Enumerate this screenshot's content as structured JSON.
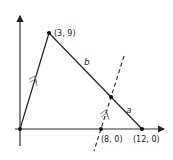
{
  "diagram": {
    "type": "coordinate-geometry",
    "points": {
      "origin": {
        "label": "",
        "x": 0,
        "y": 0
      },
      "apex": {
        "label": "(3, 9)",
        "x": 3,
        "y": 9
      },
      "right_vertex": {
        "label": "(12, 0)",
        "x": 12,
        "y": 0
      },
      "dashed_base": {
        "label": "(8, 0)",
        "x": 8,
        "y": 0
      },
      "intersection": {
        "label": ""
      }
    },
    "segments": {
      "upper": {
        "label": "b"
      },
      "lower": {
        "label": "a"
      }
    },
    "parallel_marks": "double-arrow marks on side origin–(3, 9) and on dashed line indicating they are parallel",
    "colors": {
      "line": "#222222",
      "background": "#ffffff"
    }
  }
}
